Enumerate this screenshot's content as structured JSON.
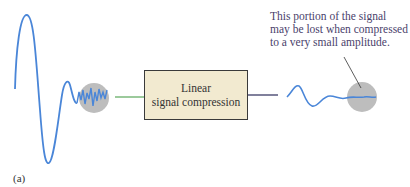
{
  "box": {
    "line1": "Linear",
    "line2": "signal compression"
  },
  "annotation": {
    "lines": [
      "This portion of the signal",
      "may be lost when compressed",
      "to a very small amplitude."
    ]
  },
  "figure_label": "(a)",
  "colors": {
    "signal": "#4a86d8",
    "circle": "#bdbdbd",
    "input_line": "#5aa65a",
    "output_line": "#2a2a5a",
    "box_fill": "#f2ead0",
    "pointer": "#333333"
  }
}
